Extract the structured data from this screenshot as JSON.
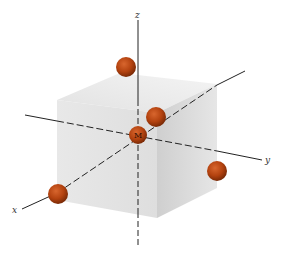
{
  "diagram": {
    "title": "",
    "center_atom": {
      "label": "M",
      "cx": 138,
      "cy": 135,
      "r": 10
    },
    "ligands": [
      {
        "name": "ligand-top",
        "cx": 126,
        "cy": 67,
        "r": 10
      },
      {
        "name": "ligand-front-top",
        "cx": 156,
        "cy": 117,
        "r": 10
      },
      {
        "name": "ligand-x-end",
        "cx": 58,
        "cy": 194,
        "r": 10
      },
      {
        "name": "ligand-right",
        "cx": 217,
        "cy": 171,
        "r": 10
      }
    ],
    "axes": {
      "x": {
        "label": "x"
      },
      "y": {
        "label": "y"
      },
      "z": {
        "label": "z"
      }
    },
    "colors": {
      "sphere": "#b3420f",
      "sphere_dark": "#7a2a06",
      "sphere_highlight": "#d8662e",
      "axis": "#222222",
      "cube_front": "#e4e4e4",
      "cube_top": "#efefef",
      "cube_right": "#d6d6d6"
    }
  }
}
